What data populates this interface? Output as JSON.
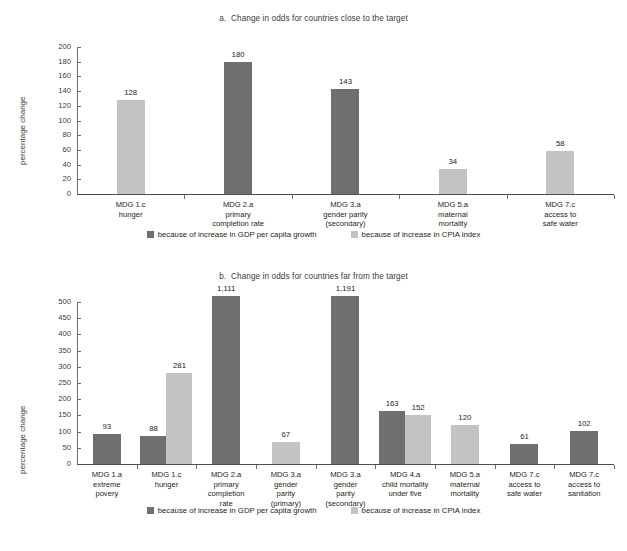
{
  "colors": {
    "gdp": "#6f6f6f",
    "cpia": "#c3c3c3",
    "axis": "#6d6d6d",
    "text": "#231f20",
    "background": "#ffffff"
  },
  "legend": {
    "gdp_label": "because of increase in GDP per capita growth",
    "cpia_label": "because of increase in CPIA index"
  },
  "chart_data": [
    {
      "id": "panel-a",
      "type": "bar",
      "title": "a.  Change in odds for countries close to the target",
      "ylabel": "percentage change",
      "xlabel": "",
      "ylim": [
        0,
        200
      ],
      "yticks": [
        0,
        20,
        40,
        60,
        80,
        100,
        120,
        140,
        160,
        180,
        200
      ],
      "ytick_labels": [
        "0",
        "20",
        "40",
        "60",
        "80",
        "100",
        "120",
        "140",
        "160",
        "180",
        "200"
      ],
      "grid": false,
      "legend_position": "bottom-center",
      "series": [
        {
          "name": "because of increase in GDP per capita growth",
          "color": "#6f6f6f",
          "values": [
            null,
            180,
            143,
            null,
            null
          ]
        },
        {
          "name": "because of increase in CPIA index",
          "color": "#c3c3c3",
          "values": [
            128,
            null,
            null,
            34,
            58
          ]
        }
      ],
      "categories": [
        "MDG 1.c\nhunger",
        "MDG 2.a\nprimary\ncompletion rate",
        "MDG 3.a\ngender parity\n(secondary)",
        "MDG 5.a\nmaternal\nmortality",
        "MDG 7.c\naccess to\nsafe water"
      ],
      "bars": [
        {
          "category": "MDG 1.c\nhunger",
          "series": "cpia",
          "value": 128,
          "label": "128"
        },
        {
          "category": "MDG 2.a\nprimary\ncompletion rate",
          "series": "gdp",
          "value": 180,
          "label": "180"
        },
        {
          "category": "MDG 3.a\ngender parity\n(secondary)",
          "series": "gdp",
          "value": 143,
          "label": "143"
        },
        {
          "category": "MDG 5.a\nmaternal\nmortality",
          "series": "cpia",
          "value": 34,
          "label": "34"
        },
        {
          "category": "MDG 7.c\naccess to\nsafe water",
          "series": "cpia",
          "value": 58,
          "label": "58"
        }
      ]
    },
    {
      "id": "panel-b",
      "type": "bar",
      "title": "b.  Change in odds for countries far from the target",
      "ylabel": "percentage change",
      "xlabel": "",
      "ylim": [
        0,
        500
      ],
      "yticks": [
        0,
        50,
        100,
        150,
        200,
        250,
        300,
        350,
        400,
        450,
        500
      ],
      "ytick_labels": [
        "0",
        "50",
        "100",
        "150",
        "200",
        "250",
        "300",
        "350",
        "400",
        "450",
        "500"
      ],
      "grid": false,
      "legend_position": "bottom-center",
      "note": "bars valued 1,111 and 1,191 are drawn truncated at the top of the axis",
      "series": [
        {
          "name": "because of increase in GDP per capita growth",
          "color": "#6f6f6f",
          "values": [
            93,
            88,
            1111,
            null,
            1191,
            163,
            null,
            61,
            102
          ]
        },
        {
          "name": "because of increase in CPIA index",
          "color": "#c3c3c3",
          "values": [
            null,
            281,
            null,
            67,
            null,
            152,
            120,
            null,
            null
          ]
        }
      ],
      "categories": [
        "MDG 1.a\nextreme\npovery",
        "MDG 1.c\nhunger",
        "MDG 2.a\nprimary\ncompletion\nrate",
        "MDG 3.a\ngender\nparity\n(primary)",
        "MDG 3.a\ngender\nparity\n(secondary)",
        "MDG 4.a\nchild mortality\nunder five",
        "MDG 5.a\nmaternal\nmortality",
        "MDG 7.c\naccess to\nsafe water",
        "MDG 7.c\naccess to\nsanitation"
      ],
      "bars": [
        {
          "category": "MDG 1.a\nextreme\npovery",
          "series": "gdp",
          "value": 93,
          "label": "93"
        },
        {
          "category": "MDG 1.c\nhunger",
          "series": "gdp",
          "value": 88,
          "label": "88"
        },
        {
          "category": "MDG 1.c\nhunger",
          "series": "cpia",
          "value": 281,
          "label": "281"
        },
        {
          "category": "MDG 2.a\nprimary\ncompletion\nrate",
          "series": "gdp",
          "value": 1111,
          "label": "1,111"
        },
        {
          "category": "MDG 3.a\ngender\nparity\n(primary)",
          "series": "cpia",
          "value": 67,
          "label": "67"
        },
        {
          "category": "MDG 3.a\ngender\nparity\n(secondary)",
          "series": "gdp",
          "value": 1191,
          "label": "1,191"
        },
        {
          "category": "MDG 4.a\nchild mortality\nunder five",
          "series": "gdp",
          "value": 163,
          "label": "163"
        },
        {
          "category": "MDG 4.a\nchild mortality\nunder five",
          "series": "cpia",
          "value": 152,
          "label": "152"
        },
        {
          "category": "MDG 5.a\nmaternal\nmortality",
          "series": "cpia",
          "value": 120,
          "label": "120"
        },
        {
          "category": "MDG 7.c\naccess to\nsafe water",
          "series": "gdp",
          "value": 61,
          "label": "61"
        },
        {
          "category": "MDG 7.c\naccess to\nsanitation",
          "series": "gdp",
          "value": 102,
          "label": "102"
        }
      ]
    }
  ]
}
